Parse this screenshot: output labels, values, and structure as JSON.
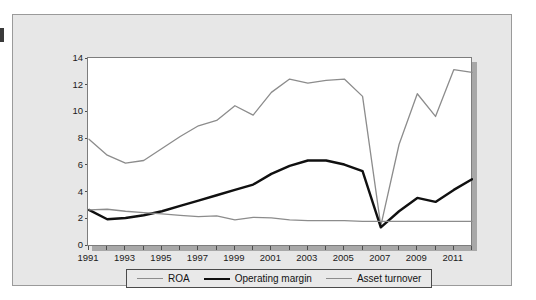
{
  "chart_data": {
    "type": "line",
    "title": "",
    "subtitle": "",
    "xlabel": "",
    "ylabel": "",
    "xlim": [
      1991,
      2012
    ],
    "ylim": [
      0,
      14
    ],
    "ytick_step": 2,
    "yticks": [
      "0",
      "2",
      "4",
      "6",
      "8",
      "10",
      "12",
      "14"
    ],
    "xticks": [
      "1991",
      "1993",
      "1995",
      "1997",
      "1999",
      "2001",
      "2003",
      "2005",
      "2007",
      "2009",
      "2011"
    ],
    "xtick_minor_every_year": true,
    "grid": false,
    "legend_position": "bottom",
    "x": [
      1991,
      1992,
      1993,
      1994,
      1995,
      1996,
      1997,
      1998,
      1999,
      2000,
      2001,
      2002,
      2003,
      2004,
      2005,
      2006,
      2007,
      2008,
      2009,
      2010,
      2011,
      2012
    ],
    "series": [
      {
        "name": "ROA",
        "color": "#8c8c8c",
        "width": 1.3,
        "values": [
          8.0,
          6.8,
          6.2,
          6.4,
          7.3,
          8.2,
          9.0,
          9.4,
          10.5,
          9.8,
          11.5,
          12.5,
          12.2,
          12.4,
          12.5,
          11.2,
          1.5,
          7.6,
          11.4,
          9.7,
          13.2,
          13.0
        ]
      },
      {
        "name": "Operating margin",
        "color": "#101010",
        "width": 2.4,
        "values": [
          2.7,
          2.0,
          2.1,
          2.3,
          2.6,
          3.0,
          3.4,
          3.8,
          4.2,
          4.6,
          5.4,
          6.0,
          6.4,
          6.4,
          6.1,
          5.6,
          1.4,
          2.6,
          3.6,
          3.3,
          4.2,
          5.0
        ]
      },
      {
        "name": "Asset turnover",
        "color": "#8c8c8c",
        "width": 1.3,
        "values": [
          2.7,
          2.75,
          2.6,
          2.5,
          2.4,
          2.3,
          2.2,
          2.25,
          1.95,
          2.15,
          2.1,
          1.95,
          1.9,
          1.9,
          1.9,
          1.85,
          1.85,
          1.85,
          1.85,
          1.85,
          1.85,
          1.85
        ]
      }
    ],
    "annotations": []
  },
  "legend": {
    "items": [
      {
        "label": "ROA"
      },
      {
        "label": "Operating margin"
      },
      {
        "label": "Asset turnover"
      }
    ]
  }
}
